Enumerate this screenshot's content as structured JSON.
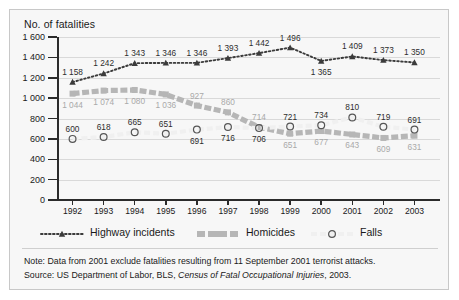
{
  "chart_data": {
    "type": "line",
    "title": "",
    "ylabel": "No. of fatalities",
    "xlabel": "",
    "ylim": [
      0,
      1600
    ],
    "grid": true,
    "legend_position": "bottom",
    "yticks": [
      "0",
      "200",
      "400",
      "600",
      "800",
      "1 000",
      "1 200",
      "1 400",
      "1 600"
    ],
    "ytick_values": [
      0,
      200,
      400,
      600,
      800,
      1000,
      1200,
      1400,
      1600
    ],
    "categories": [
      "1992",
      "1993",
      "1994",
      "1995",
      "1996",
      "1997",
      "1998",
      "1999",
      "2000",
      "2001",
      "2002",
      "2003"
    ],
    "series": [
      {
        "name": "Highway incidents",
        "marker": "triangle",
        "color": "#3b3b3b",
        "values": [
          1158,
          1242,
          1343,
          1346,
          1346,
          1393,
          1442,
          1496,
          1365,
          1409,
          1373,
          1350
        ],
        "labels": [
          "1 158",
          "1 242",
          "1 343",
          "1 346",
          "1 346",
          "1 393",
          "1 442",
          "1 496",
          "1 365",
          "1 409",
          "1 373",
          "1 350"
        ],
        "label_pos": [
          "above",
          "above",
          "above",
          "above",
          "above",
          "above",
          "above",
          "above",
          "below",
          "above",
          "above",
          "above"
        ]
      },
      {
        "name": "Homicides",
        "marker": "square",
        "color": "#b6b6b6",
        "values": [
          1044,
          1074,
          1080,
          1036,
          927,
          860,
          714,
          651,
          677,
          643,
          609,
          631
        ],
        "labels": [
          "1 044",
          "1 074",
          "1 080",
          "1 036",
          "927",
          "860",
          "714",
          "651",
          "677",
          "643",
          "609",
          "631"
        ],
        "label_pos": [
          "below",
          "below",
          "below",
          "below",
          "above",
          "above",
          "above",
          "below",
          "below",
          "below",
          "below",
          "below"
        ]
      },
      {
        "name": "Falls",
        "marker": "circle",
        "color": "#f0f0f0",
        "values": [
          600,
          618,
          665,
          651,
          691,
          716,
          706,
          721,
          734,
          810,
          719,
          691
        ],
        "labels": [
          "600",
          "618",
          "665",
          "651",
          "691",
          "716",
          "706",
          "721",
          "734",
          "810",
          "719",
          "691"
        ],
        "label_pos": [
          "above",
          "above",
          "above",
          "above",
          "below",
          "below",
          "below",
          "above",
          "above",
          "above",
          "above",
          "above"
        ]
      }
    ]
  },
  "legend": {
    "items": [
      {
        "label": "Highway incidents",
        "icon": "dotted-triangle-series-icon"
      },
      {
        "label": "Homicides",
        "icon": "dashed-square-series-icon"
      },
      {
        "label": "Falls",
        "icon": "dotted-circle-series-icon"
      }
    ]
  },
  "footnotes": {
    "note_prefix": "Note: ",
    "note_text": "Data from 2001 exclude fatalities resulting from 11 September 2001 terrorist attacks.",
    "source_prefix": "Source: ",
    "source_pre_italic": "US Department of Labor, BLS, ",
    "source_italic": "Census of Fatal Occupational Injuries",
    "source_post_italic": ", 2003."
  },
  "colors": {
    "panel_bg": "#f7f7f7",
    "panel_border": "#c8c8c8",
    "axis": "#2b2b2b",
    "grid": "#d9d9d9",
    "highway": "#3b3b3b",
    "homicides": "#b6b6b6",
    "falls": "#f0f0f0"
  }
}
